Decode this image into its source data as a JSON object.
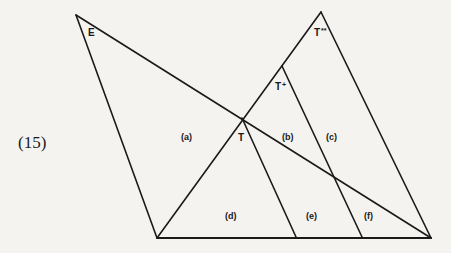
{
  "figure": {
    "number": "(15)",
    "stroke_color": "#1a1a1a",
    "background_color": "#f4f3f0",
    "points": {
      "E_apex": [
        76,
        15
      ],
      "top_apex": [
        321,
        12
      ],
      "T": [
        242,
        118
      ],
      "T_plus": [
        282,
        66
      ],
      "bottom_left": [
        157,
        238
      ],
      "bottom_right": [
        431,
        238
      ],
      "base_e": [
        296,
        237
      ],
      "base_f": [
        362,
        237
      ]
    },
    "vertex_labels": [
      {
        "id": "E",
        "text": "E",
        "sup": ""
      },
      {
        "id": "T",
        "text": "T",
        "sup": ""
      },
      {
        "id": "T_plus",
        "text": "T",
        "sup": "+"
      },
      {
        "id": "T_star",
        "text": "T",
        "sup": "**"
      }
    ],
    "region_labels": [
      {
        "id": "a",
        "text": "(a)"
      },
      {
        "id": "b",
        "text": "(b)"
      },
      {
        "id": "c",
        "text": "(c)"
      },
      {
        "id": "d",
        "text": "(d)"
      },
      {
        "id": "e",
        "text": "(e)"
      },
      {
        "id": "f",
        "text": "(f)"
      }
    ]
  }
}
